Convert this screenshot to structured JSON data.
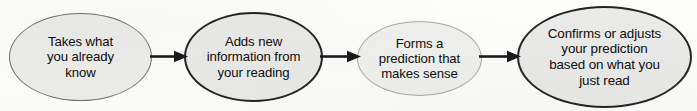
{
  "diagram": {
    "type": "flowchart",
    "orientation": "horizontal",
    "background_color": "#fdfdfc",
    "node_fill_color": "#ececeb",
    "text_color": "#0d0d0d",
    "nodes": [
      {
        "id": "prior-knowledge",
        "shape": "ellipse",
        "text": "Takes what\nyou already\nknow",
        "lines": [
          "Takes what",
          "you already",
          "know"
        ],
        "border_color": "#6f6f6f"
      },
      {
        "id": "new-information",
        "shape": "ellipse",
        "text": "Adds new\ninformation from\nyour reading",
        "lines": [
          "Adds new",
          "information from",
          "your reading"
        ],
        "border_color": "#232323"
      },
      {
        "id": "prediction",
        "shape": "ellipse",
        "text": "Forms a\nprediction that\nmakes sense",
        "lines": [
          "Forms a",
          "prediction that",
          "makes sense"
        ],
        "border_color": "#a9a9a9"
      },
      {
        "id": "confirm-adjust",
        "shape": "ellipse",
        "text": "Confirms or adjusts\nyour prediction\nbased on what you\njust read",
        "lines": [
          "Confirms or adjusts",
          "your prediction",
          "based on what you",
          "just read"
        ],
        "border_color": "#242424"
      }
    ],
    "connectors": [
      {
        "id": "arrow-1",
        "from": "prior-knowledge",
        "to": "new-information",
        "style": "solid-arrow",
        "color": "#1a1a1a"
      },
      {
        "id": "arrow-2",
        "from": "new-information",
        "to": "prediction",
        "style": "solid-arrow",
        "color": "#1a1a1a"
      },
      {
        "id": "arrow-3",
        "from": "prediction",
        "to": "confirm-adjust",
        "style": "solid-arrow",
        "color": "#1a1a1a"
      }
    ]
  }
}
